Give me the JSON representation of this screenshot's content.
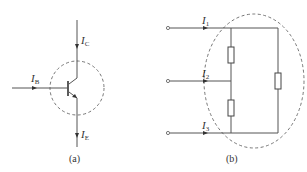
{
  "diagram_a": {
    "caption": "(a)",
    "currents": {
      "collector": {
        "symbol": "I",
        "subscript": "C"
      },
      "base": {
        "symbol": "I",
        "subscript": "B"
      },
      "emitter": {
        "symbol": "I",
        "subscript": "E"
      }
    },
    "component": "bjt-npn-transistor",
    "boundary": "dashed-circle"
  },
  "diagram_b": {
    "caption": "(b)",
    "currents": [
      {
        "symbol": "I",
        "subscript": "1"
      },
      {
        "symbol": "I",
        "subscript": "2"
      },
      {
        "symbol": "I",
        "subscript": "3"
      }
    ],
    "resistor_count": 3,
    "terminal_count": 3,
    "boundary": "dashed-ellipse"
  },
  "colors": {
    "line": "#555555",
    "dash": "#666666",
    "text": "#333333"
  }
}
